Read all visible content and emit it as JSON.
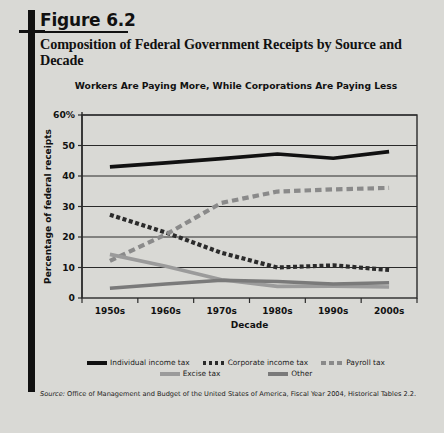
{
  "figure": {
    "number": "Figure 6.2",
    "title": "Composition of Federal Government Receipts by Source and Decade",
    "subtitle": "Workers Are Paying More, While Corporations Are Paying Less",
    "source_word": "Source:",
    "source_text": " Office of Management and Budget of the United States of America, Fiscal Year 2004, Historical Tables 2.2."
  },
  "chart_data": {
    "type": "line",
    "title": "Workers Are Paying More, While Corporations Are Paying Less",
    "xlabel": "Decade",
    "ylabel": "Percentage of federal receipts",
    "categories": [
      "1950s",
      "1960s",
      "1970s",
      "1980s",
      "1990s",
      "2000s"
    ],
    "ylim": [
      0,
      60
    ],
    "yticks": [
      0,
      10,
      20,
      30,
      40,
      50,
      60
    ],
    "ytick_labels": [
      "0",
      "10",
      "20",
      "30",
      "40",
      "50",
      "60%"
    ],
    "grid": true,
    "legend_position": "bottom",
    "series": [
      {
        "name": "Individual income tax",
        "style": "solid",
        "color": "#111111",
        "values": [
          43.0,
          44.3,
          45.7,
          47.2,
          45.8,
          48.0
        ]
      },
      {
        "name": "Corporate income tax",
        "style": "dashed-small",
        "color": "#2b2b2b",
        "values": [
          27.3,
          21.5,
          14.8,
          10.0,
          10.7,
          9.2
        ]
      },
      {
        "name": "Payroll tax",
        "style": "dashed-large",
        "color": "#8a8a8a",
        "values": [
          12.2,
          20.8,
          31.2,
          34.9,
          35.6,
          36.1
        ]
      },
      {
        "name": "Excise tax",
        "style": "solid",
        "color": "#9b9b9b",
        "values": [
          14.3,
          10.4,
          6.0,
          3.8,
          3.9,
          3.6
        ]
      },
      {
        "name": "Other",
        "style": "solid",
        "color": "#7a7a7a",
        "values": [
          3.2,
          4.6,
          5.8,
          5.4,
          4.6,
          5.0
        ]
      }
    ]
  },
  "legend": {
    "row1": [
      {
        "label": "Individual income tax",
        "key": "individual-income-tax"
      },
      {
        "label": "Corporate income tax",
        "key": "corporate-income-tax"
      },
      {
        "label": "Payroll tax",
        "key": "payroll-tax"
      }
    ],
    "row2": [
      {
        "label": "Excise tax",
        "key": "excise-tax"
      },
      {
        "label": "Other",
        "key": "other"
      }
    ]
  }
}
